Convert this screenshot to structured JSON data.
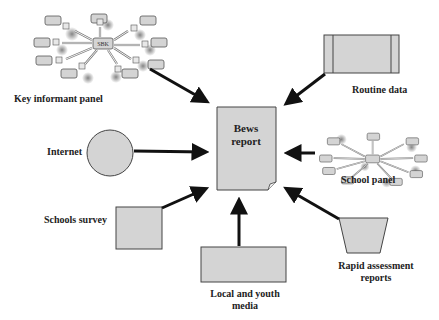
{
  "diagram": {
    "center": {
      "title_line1": "Bews",
      "title_line2": "report"
    },
    "sources": [
      {
        "id": "key-informant-panel",
        "label": "Key informant panel",
        "shape": "network"
      },
      {
        "id": "routine-data",
        "label": "Routine data",
        "shape": "rectangle-with-bars"
      },
      {
        "id": "internet",
        "label": "Internet",
        "shape": "circle"
      },
      {
        "id": "school-panel",
        "label": "School panel",
        "shape": "network"
      },
      {
        "id": "schools-survey",
        "label": "Schools survey",
        "shape": "square"
      },
      {
        "id": "local-youth-media",
        "label_line1": "Local and youth",
        "label_line2": "media",
        "shape": "rectangle"
      },
      {
        "id": "rapid-assessment",
        "label_line1": "Rapid assessment",
        "label_line2": "reports",
        "shape": "trapezoid"
      }
    ],
    "network_hub_label": "SBK",
    "node_tag": "S",
    "colors": {
      "fill": "#d4d4d4",
      "stroke": "#555555",
      "arrow": "#111111"
    }
  }
}
